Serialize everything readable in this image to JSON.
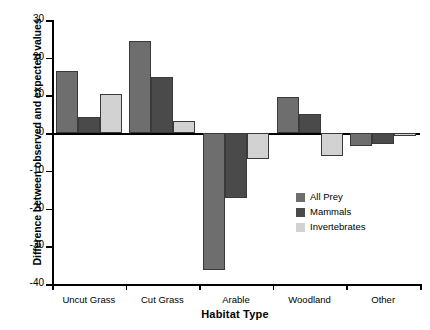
{
  "chart_data": {
    "type": "bar",
    "title": "",
    "xlabel": "Habitat Type",
    "ylabel": "Difference between observed and expected values",
    "categories": [
      "Uncut Grass",
      "Cut Grass",
      "Arable",
      "Woodland",
      "Other"
    ],
    "series": [
      {
        "name": "All Prey",
        "color": "#6e6e6e",
        "values": [
          16.5,
          24.3,
          -36.3,
          9.5,
          -3.5
        ]
      },
      {
        "name": "Mammals",
        "color": "#4a4a4a",
        "values": [
          4.2,
          15.0,
          -17.3,
          5.0,
          -3.0
        ]
      },
      {
        "name": "Invertebrates",
        "color": "#d2d2d2",
        "values": [
          10.5,
          3.3,
          -6.8,
          -6.0,
          -0.8
        ]
      }
    ],
    "ylim": [
      -40,
      30
    ],
    "yticks": [
      30,
      20,
      10,
      0,
      -10,
      -20,
      -30,
      -40
    ],
    "ytick_labels": [
      "30",
      "20",
      "10",
      "0",
      "-10",
      "-20",
      "-30",
      "-40"
    ],
    "grid": false,
    "legend_position": "center-right",
    "zero_line": 0
  },
  "legend": {
    "entries": [
      {
        "label": "All Prey"
      },
      {
        "label": "Mammals"
      },
      {
        "label": "Invertebrates"
      }
    ]
  }
}
